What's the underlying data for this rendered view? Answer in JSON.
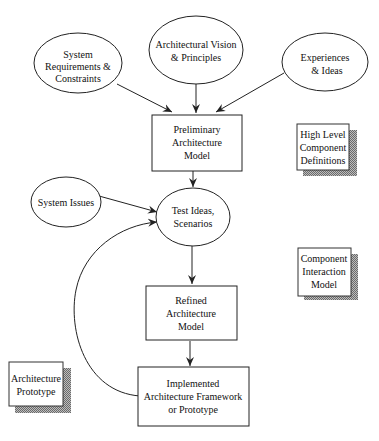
{
  "diagram": {
    "nodes": {
      "system_requirements": {
        "shape": "ellipse",
        "lines": [
          "System",
          "Requirements &",
          "Constraints"
        ]
      },
      "vision": {
        "shape": "ellipse",
        "lines": [
          "Architectural Vision",
          "& Principles"
        ]
      },
      "experiences": {
        "shape": "ellipse",
        "lines": [
          "Experiences",
          "& Ideas"
        ]
      },
      "preliminary": {
        "shape": "box",
        "lines": [
          "Preliminary",
          "Architecture",
          "Model"
        ]
      },
      "system_issues": {
        "shape": "ellipse",
        "lines": [
          "System Issues"
        ]
      },
      "test_ideas": {
        "shape": "ellipse",
        "lines": [
          "Test Ideas,",
          "Scenarios"
        ]
      },
      "refined": {
        "shape": "box",
        "lines": [
          "Refined",
          "Architecture",
          "Model"
        ]
      },
      "implemented": {
        "shape": "box",
        "lines": [
          "Implemented",
          "Architecture Framework",
          "or Prototype"
        ]
      }
    },
    "artifacts": {
      "high_level": {
        "lines": [
          "High Level",
          "Component",
          "Definitions"
        ]
      },
      "component_interaction": {
        "lines": [
          "Component",
          "Interaction",
          "Model"
        ]
      },
      "architecture_prototype": {
        "lines": [
          "Architecture",
          "Prototype"
        ]
      }
    },
    "edges": [
      {
        "from": "system_requirements",
        "to": "preliminary"
      },
      {
        "from": "vision",
        "to": "preliminary"
      },
      {
        "from": "experiences",
        "to": "preliminary"
      },
      {
        "from": "preliminary",
        "to": "test_ideas"
      },
      {
        "from": "system_issues",
        "to": "test_ideas"
      },
      {
        "from": "test_ideas",
        "to": "refined"
      },
      {
        "from": "refined",
        "to": "implemented"
      },
      {
        "from": "implemented",
        "to": "test_ideas",
        "style": "curved"
      }
    ],
    "colors": {
      "stroke": "#222222",
      "shadow": "#8a8a8a",
      "background": "#ffffff"
    }
  }
}
